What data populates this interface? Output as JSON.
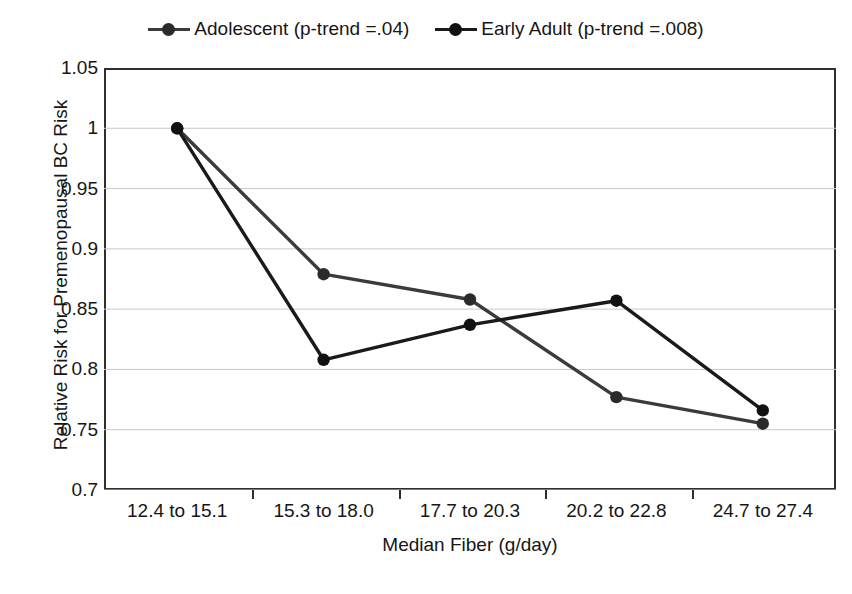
{
  "chart_data": {
    "type": "line",
    "title": "",
    "xlabel": "Median Fiber (g/day)",
    "ylabel": "Relative Risk for Premenopausal BC Risk",
    "categories": [
      "12.4 to 15.1",
      "15.3 to 18.0",
      "17.7 to 20.3",
      "20.2 to 22.8",
      "24.7 to 27.4"
    ],
    "ylim": [
      0.7,
      1.05
    ],
    "yticks": [
      "0.7",
      "0.75",
      "0.8",
      "0.85",
      "0.9",
      "0.95",
      "1",
      "1.05"
    ],
    "ytick_values": [
      0.7,
      0.75,
      0.8,
      0.85,
      0.9,
      0.95,
      1.0,
      1.05
    ],
    "grid": "horizontal",
    "legend_position": "top-center",
    "series": [
      {
        "name": "Adolescent (p-trend =.04)",
        "color": "#3b3b3b",
        "marker_color": "#2b2b2b",
        "values": [
          1.0,
          0.879,
          0.858,
          0.777,
          0.755
        ]
      },
      {
        "name": "Early Adult (p-trend =.008)",
        "color": "#1a1a1a",
        "marker_color": "#111111",
        "values": [
          1.0,
          0.808,
          0.837,
          0.857,
          0.766
        ]
      }
    ]
  },
  "legend": {
    "items": [
      {
        "label": "Adolescent (p-trend =.04)"
      },
      {
        "label": "Early Adult (p-trend =.008)"
      }
    ]
  },
  "axes": {
    "y_title": "Relative Risk for Premenopausal BC Risk",
    "x_title": "Median Fiber (g/day)"
  }
}
